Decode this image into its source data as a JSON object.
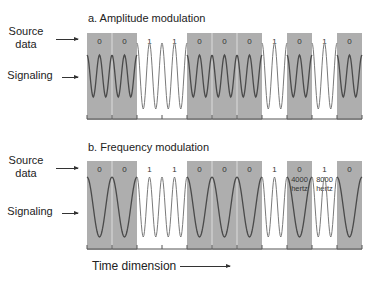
{
  "colors": {
    "gray_cell": "#aeaeae",
    "wave_dark": "#4a4a4a",
    "wave_light": "#7a7a7a",
    "bit_label": "#333333"
  },
  "labels": {
    "source_data": [
      "Source",
      "data"
    ],
    "signaling": "Signaling",
    "time_dimension": "Time dimension"
  },
  "panels": [
    {
      "id": "amplitude",
      "title": "a. Amplitude modulation",
      "bits": [
        "0",
        "0",
        "1",
        "1",
        "0",
        "0",
        "0",
        "1",
        "0",
        "1",
        "0"
      ],
      "cell_annotations": {}
    },
    {
      "id": "frequency",
      "title": "b. Frequency modulation",
      "bits": [
        "0",
        "0",
        "1",
        "1",
        "0",
        "0",
        "0",
        "1",
        "0",
        "1",
        "0"
      ],
      "cell_annotations": {
        "8": [
          "4000",
          "hertz"
        ],
        "9": [
          "8000",
          "hertz"
        ]
      }
    }
  ]
}
